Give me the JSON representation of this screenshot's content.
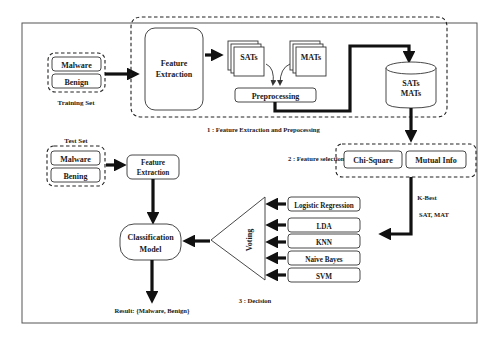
{
  "training_set": {
    "items": [
      "Malware",
      "Benign"
    ],
    "caption": "Training Set"
  },
  "stage1": {
    "feature_extraction": [
      "Feature",
      "Extraction"
    ],
    "sats_label": "SATs",
    "mats_label": "MATs",
    "preprocessing": "Preprocessing",
    "db_lines": [
      "SATs",
      "MATs"
    ],
    "caption": "1 : Feature Extraction and Prepocessing"
  },
  "stage2": {
    "caption": "2 : Feature selection",
    "methods": [
      "Chi-Square",
      "Mutual Info"
    ],
    "kbest_label": "K-Best",
    "kbest_sub": "SAT, MAT"
  },
  "test_set": {
    "caption": "Test Set",
    "items": [
      "Malware",
      "Bening"
    ],
    "feature_extraction": [
      "Feature",
      "Extraction"
    ]
  },
  "stage3": {
    "classifiers": [
      "Logistic Regression",
      "LDA",
      "KNN",
      "Naive Bayes",
      "SVM"
    ],
    "voting_label": "Voting",
    "model": [
      "Classification",
      "Model"
    ],
    "caption": "3 : Decision",
    "result": "Result: {Malware, Benign}"
  },
  "colors": {
    "stroke": "#111111",
    "background": "#ffffff"
  }
}
